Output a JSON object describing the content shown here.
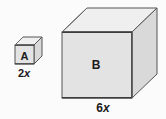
{
  "figure": {
    "type": "geometry-diagram",
    "background_color": "#fbfbfb",
    "outline_color": "#555555",
    "edge_dark_color": "#3c3c3c",
    "faces": {
      "top_color": "#efefef",
      "front_color": "#e3e3e3",
      "side_color": "#d9d9d9"
    },
    "shapes": [
      {
        "id": "cube-a",
        "face_label": "A",
        "dimension_label": "2x",
        "dimension_coefficient": "2",
        "dimension_variable": "x",
        "edge_length_px": 19
      },
      {
        "id": "cube-b",
        "face_label": "B",
        "dimension_label": "6x",
        "dimension_coefficient": "6",
        "dimension_variable": "x",
        "edge_length_px": 70
      }
    ]
  }
}
